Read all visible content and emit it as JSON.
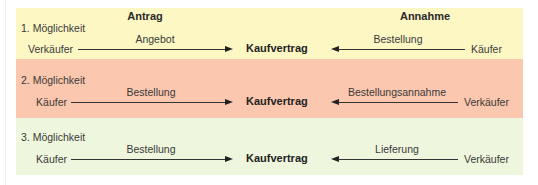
{
  "columns": {
    "left_header": "Antrag",
    "right_header": "Annahme"
  },
  "center_label": "Kaufvertrag",
  "colors": {
    "section_1": "#fdf7c4",
    "section_2": "#fbc7ae",
    "section_3": "#eef6dd",
    "separator": "#b98a6e"
  },
  "options": [
    {
      "label": "1. Möglichkeit",
      "left_party": "Verkäufer",
      "left_message": "Angebot",
      "right_message": "Bestellung",
      "right_party": "Käufer"
    },
    {
      "label": "2. Möglichkeit",
      "left_party": "Käufer",
      "left_message": "Bestellung",
      "right_message": "Bestellungsannahme",
      "right_party": "Verkäufer"
    },
    {
      "label": "3. Möglichkeit",
      "left_party": "Käufer",
      "left_message": "Bestellung",
      "right_message": "Lieferung",
      "right_party": "Verkäufer"
    }
  ]
}
